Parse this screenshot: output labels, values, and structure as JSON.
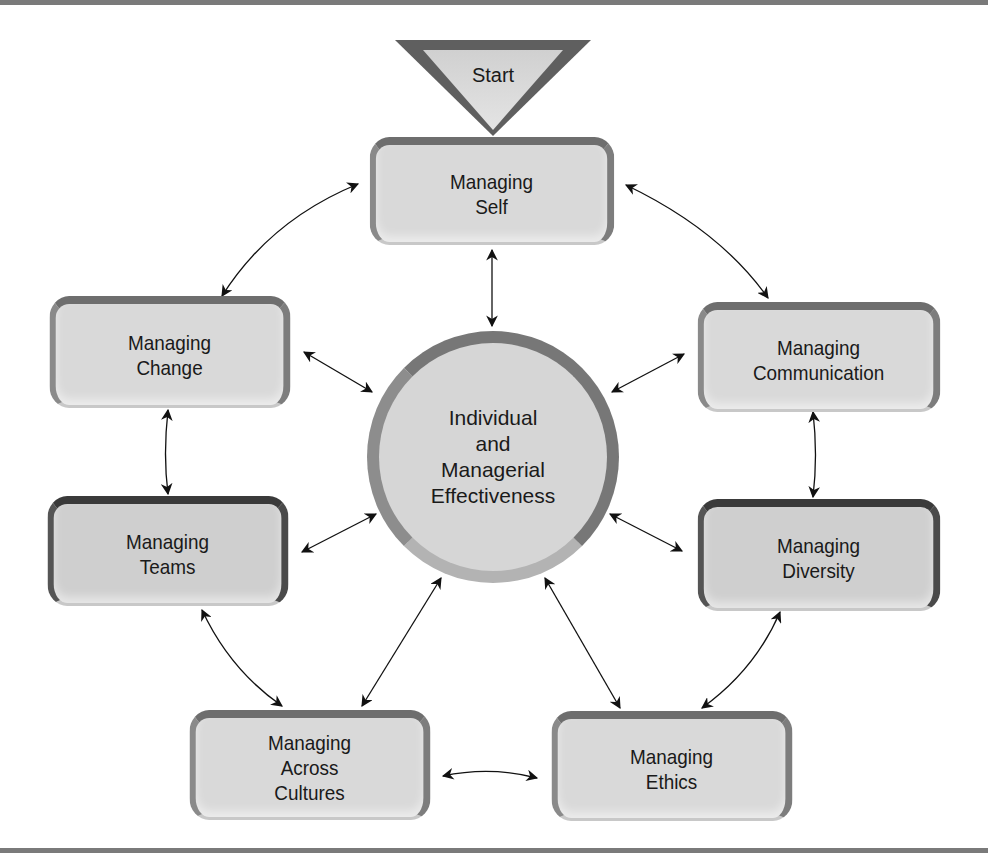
{
  "diagram": {
    "start": {
      "label": "Start"
    },
    "hub": {
      "label": "Individual\nand\nManagerial\nEffectiveness"
    },
    "nodes": {
      "self": {
        "label": "Managing\nSelf"
      },
      "change": {
        "label": "Managing\nChange"
      },
      "communication": {
        "label": "Managing\nCommunication"
      },
      "teams": {
        "label": "Managing\nTeams"
      },
      "diversity": {
        "label": "Managing\nDiversity"
      },
      "cultures": {
        "label": "Managing\nAcross\nCultures"
      },
      "ethics": {
        "label": "Managing\nEthics"
      }
    },
    "connections": [
      [
        "start",
        "self"
      ],
      [
        "self",
        "hub"
      ],
      [
        "self",
        "change"
      ],
      [
        "self",
        "communication"
      ],
      [
        "change",
        "hub"
      ],
      [
        "change",
        "teams"
      ],
      [
        "communication",
        "hub"
      ],
      [
        "communication",
        "diversity"
      ],
      [
        "teams",
        "hub"
      ],
      [
        "teams",
        "cultures"
      ],
      [
        "diversity",
        "hub"
      ],
      [
        "diversity",
        "ethics"
      ],
      [
        "cultures",
        "hub"
      ],
      [
        "cultures",
        "ethics"
      ],
      [
        "ethics",
        "hub"
      ]
    ],
    "colors": {
      "fill": "#d9d9d9",
      "border": "#6e6e6e",
      "rule": "#7a7a7a",
      "text": "#1a1a1a"
    }
  }
}
